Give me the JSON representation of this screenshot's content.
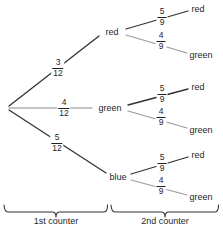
{
  "diagram": {
    "root": {
      "x": 8,
      "y": 108
    },
    "stage1": {
      "branches": [
        {
          "id": "branch-red",
          "label": "red",
          "probability": {
            "numerator": "3",
            "denominator": "12"
          },
          "prob_x": 58,
          "prob_y": 68,
          "node_x": 112,
          "node_y": 32,
          "line_from_x": 9,
          "line_from_y": 106,
          "line_to_x": 99,
          "line_to_y": 36,
          "stroke": "#333333",
          "width": 1.3
        },
        {
          "id": "branch-green",
          "label": "green",
          "probability": {
            "numerator": "4",
            "denominator": "12"
          },
          "prob_x": 64,
          "prob_y": 108,
          "node_x": 110,
          "node_y": 108,
          "line_from_x": 9,
          "line_from_y": 108,
          "line_to_x": 92,
          "line_to_y": 108,
          "stroke": "#8a8a8a",
          "width": 1.1
        },
        {
          "id": "branch-blue",
          "label": "blue",
          "probability": {
            "numerator": "5",
            "denominator": "12"
          },
          "prob_x": 57,
          "prob_y": 143,
          "node_x": 118,
          "node_y": 177,
          "line_from_x": 9,
          "line_from_y": 110,
          "line_to_x": 106,
          "line_to_y": 173,
          "stroke": "#333333",
          "width": 1.3
        }
      ]
    },
    "stage2": {
      "groups": [
        {
          "id": "group-from-red",
          "parent": "red",
          "branches": [
            {
              "id": "red-red",
              "label": "red",
              "probability": {
                "numerator": "5",
                "denominator": "9"
              },
              "prob_x": 162,
              "prob_y": 17,
              "node_x": 198,
              "node_y": 9,
              "line_from_x": 126,
              "line_from_y": 29,
              "line_to_x": 188,
              "line_to_y": 11,
              "stroke": "#333333",
              "width": 1.3
            },
            {
              "id": "red-green",
              "label": "green",
              "probability": {
                "numerator": "4",
                "denominator": "9"
              },
              "prob_x": 161,
              "prob_y": 41,
              "node_x": 201,
              "node_y": 55,
              "line_from_x": 126,
              "line_from_y": 35,
              "line_to_x": 187,
              "line_to_y": 53,
              "stroke": "#9a9a9a",
              "width": 1.1
            }
          ]
        },
        {
          "id": "group-from-green",
          "parent": "green",
          "branches": [
            {
              "id": "green-red",
              "label": "red",
              "probability": {
                "numerator": "5",
                "denominator": "9"
              },
              "prob_x": 162,
              "prob_y": 94,
              "node_x": 198,
              "node_y": 87,
              "line_from_x": 128,
              "line_from_y": 105,
              "line_to_x": 188,
              "line_to_y": 89,
              "stroke": "#333333",
              "width": 1.3
            },
            {
              "id": "green-green",
              "label": "green",
              "probability": {
                "numerator": "4",
                "denominator": "9"
              },
              "prob_x": 161,
              "prob_y": 117,
              "node_x": 201,
              "node_y": 130,
              "line_from_x": 128,
              "line_from_y": 111,
              "line_to_x": 187,
              "line_to_y": 128,
              "stroke": "#9a9a9a",
              "width": 1.1
            }
          ]
        },
        {
          "id": "group-from-blue",
          "parent": "blue",
          "branches": [
            {
              "id": "blue-red",
              "label": "red",
              "probability": {
                "numerator": "5",
                "denominator": "9"
              },
              "prob_x": 162,
              "prob_y": 163,
              "node_x": 198,
              "node_y": 155,
              "line_from_x": 131,
              "line_from_y": 174,
              "line_to_x": 188,
              "line_to_y": 157,
              "stroke": "#333333",
              "width": 1.3
            },
            {
              "id": "blue-green",
              "label": "green",
              "probability": {
                "numerator": "4",
                "denominator": "9"
              },
              "prob_x": 161,
              "prob_y": 186,
              "node_x": 201,
              "node_y": 197,
              "line_from_x": 131,
              "line_from_y": 180,
              "line_to_x": 187,
              "line_to_y": 195,
              "stroke": "#9a9a9a",
              "width": 1.1
            }
          ]
        }
      ]
    },
    "braces": [
      {
        "id": "brace-1st-counter",
        "caption": "1st counter",
        "x_start": 4,
        "x_end": 108,
        "y": 205,
        "caption_x": 56,
        "caption_y": 221
      },
      {
        "id": "brace-2nd-counter",
        "caption": "2nd counter",
        "x_start": 111,
        "x_end": 219,
        "y": 205,
        "caption_x": 165,
        "caption_y": 221
      }
    ],
    "colors": {
      "line_dark": "#333333",
      "line_light": "#9a9a9a",
      "text": "#1f1f1f",
      "background": "#ffffff"
    }
  }
}
